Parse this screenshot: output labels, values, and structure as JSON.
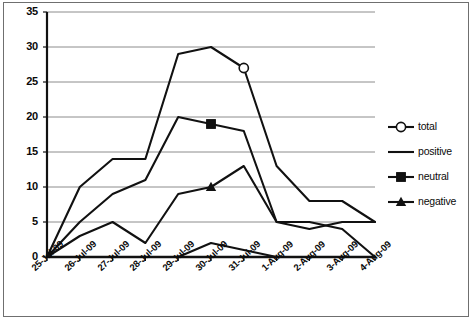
{
  "chart_data": {
    "type": "line",
    "title": "",
    "xlabel": "",
    "ylabel": "",
    "ylim": [
      0,
      35
    ],
    "yticks": [
      0,
      5,
      10,
      15,
      20,
      25,
      30,
      35
    ],
    "grid": true,
    "legend_position": "right",
    "categories": [
      "25-Jul-09",
      "26-Jul-09",
      "27-Jul-09",
      "28-Jul-09",
      "29-Jul-09",
      "30-Jul-09",
      "31-Jul-09",
      "1-Aug-09",
      "2-Aug-09",
      "3-Aug-09",
      "4-Aug-09"
    ],
    "series": [
      {
        "name": "total",
        "marker": "circle",
        "values": [
          0,
          10,
          14,
          14,
          29,
          30,
          27,
          13,
          8,
          8,
          5
        ]
      },
      {
        "name": "positive",
        "marker": "none",
        "values": [
          0,
          0,
          0,
          0,
          0,
          2,
          1,
          0,
          0,
          0,
          0
        ]
      },
      {
        "name": "neutral",
        "marker": "square",
        "values": [
          0,
          5,
          9,
          11,
          20,
          19,
          18,
          5,
          4,
          5,
          5
        ]
      },
      {
        "name": "negative",
        "marker": "triangle",
        "values": [
          0,
          3,
          5,
          2,
          9,
          10,
          13,
          5,
          5,
          4,
          0
        ]
      }
    ]
  },
  "legend": {
    "items": [
      {
        "label": "total",
        "marker": "circle-marker-icon"
      },
      {
        "label": "positive",
        "marker": "line-marker-icon"
      },
      {
        "label": "neutral",
        "marker": "square-marker-icon"
      },
      {
        "label": "negative",
        "marker": "triangle-marker-icon"
      }
    ]
  }
}
